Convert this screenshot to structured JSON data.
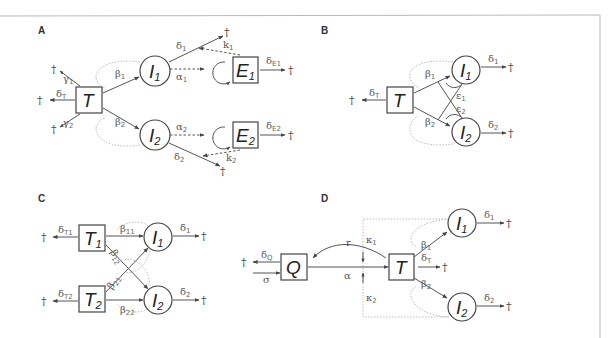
{
  "figure": {
    "panels": [
      {
        "id": "A",
        "label": "A",
        "nodes": [
          {
            "name": "T",
            "shape": "box",
            "text": "T",
            "sub": ""
          },
          {
            "name": "I1",
            "shape": "circle",
            "text": "I",
            "sub": "1"
          },
          {
            "name": "I2",
            "shape": "circle",
            "text": "I",
            "sub": "2"
          },
          {
            "name": "E1",
            "shape": "box",
            "text": "E",
            "sub": "1"
          },
          {
            "name": "E2",
            "shape": "box",
            "text": "E",
            "sub": "2"
          }
        ],
        "params": {
          "gamma1": {
            "base": "γ",
            "sub": "1"
          },
          "gamma2": {
            "base": "γ",
            "sub": "2"
          },
          "deltaT": {
            "base": "δ",
            "sub": "T"
          },
          "beta1": {
            "base": "β",
            "sub": "1"
          },
          "beta2": {
            "base": "β",
            "sub": "2"
          },
          "delta1": {
            "base": "δ",
            "sub": "1"
          },
          "delta2": {
            "base": "δ",
            "sub": "2"
          },
          "alpha1": {
            "base": "α",
            "sub": "1"
          },
          "alpha2": {
            "base": "α",
            "sub": "2"
          },
          "kappa1": {
            "base": "k",
            "sub": "1"
          },
          "kappa2": {
            "base": "k",
            "sub": "2"
          },
          "deltaE1": {
            "base": "δ",
            "sub": "E1"
          },
          "deltaE2": {
            "base": "δ",
            "sub": "E2"
          }
        }
      },
      {
        "id": "B",
        "label": "B",
        "nodes": [
          {
            "name": "T",
            "shape": "box",
            "text": "T",
            "sub": ""
          },
          {
            "name": "I1",
            "shape": "circle",
            "text": "I",
            "sub": "1"
          },
          {
            "name": "I2",
            "shape": "circle",
            "text": "I",
            "sub": "2"
          }
        ],
        "params": {
          "deltaT": {
            "base": "δ",
            "sub": "T"
          },
          "beta1": {
            "base": "β",
            "sub": "1"
          },
          "beta2": {
            "base": "β",
            "sub": "2"
          },
          "eps1": {
            "base": "ε",
            "sub": "1"
          },
          "eps2": {
            "base": "ε",
            "sub": "2"
          },
          "delta1": {
            "base": "δ",
            "sub": "1"
          },
          "delta2": {
            "base": "δ",
            "sub": "2"
          }
        }
      },
      {
        "id": "C",
        "label": "C",
        "nodes": [
          {
            "name": "T1",
            "shape": "box",
            "text": "T",
            "sub": "1"
          },
          {
            "name": "T2",
            "shape": "box",
            "text": "T",
            "sub": "2"
          },
          {
            "name": "I1",
            "shape": "circle",
            "text": "I",
            "sub": "1"
          },
          {
            "name": "I2",
            "shape": "circle",
            "text": "I",
            "sub": "2"
          }
        ],
        "params": {
          "deltaT1": {
            "base": "δ",
            "sub": "T1"
          },
          "deltaT2": {
            "base": "δ",
            "sub": "T2"
          },
          "beta11": {
            "base": "β",
            "sub": "11"
          },
          "beta12": {
            "base": "β",
            "sub": "12"
          },
          "beta21": {
            "base": "β",
            "sub": "21"
          },
          "beta22": {
            "base": "β",
            "sub": "22"
          },
          "delta1": {
            "base": "δ",
            "sub": "1"
          },
          "delta2": {
            "base": "δ",
            "sub": "2"
          }
        }
      },
      {
        "id": "D",
        "label": "D",
        "nodes": [
          {
            "name": "Q",
            "shape": "box",
            "text": "Q",
            "sub": ""
          },
          {
            "name": "T",
            "shape": "box",
            "text": "T",
            "sub": ""
          },
          {
            "name": "I1",
            "shape": "circle",
            "text": "I",
            "sub": "1"
          },
          {
            "name": "I2",
            "shape": "circle",
            "text": "I",
            "sub": "2"
          }
        ],
        "params": {
          "deltaQ": {
            "base": "δ",
            "sub": "Q"
          },
          "sigma": {
            "base": "σ",
            "sub": ""
          },
          "r": {
            "base": "r",
            "sub": ""
          },
          "alpha": {
            "base": "α",
            "sub": ""
          },
          "kappa1": {
            "base": "κ",
            "sub": "1"
          },
          "kappa2": {
            "base": "κ",
            "sub": "2"
          },
          "deltaT": {
            "base": "δ",
            "sub": "T"
          },
          "beta1": {
            "base": "β",
            "sub": "1"
          },
          "beta2": {
            "base": "β",
            "sub": "2"
          },
          "delta1": {
            "base": "δ",
            "sub": "1"
          },
          "delta2": {
            "base": "δ",
            "sub": "2"
          }
        }
      }
    ],
    "death_symbol": "†"
  }
}
